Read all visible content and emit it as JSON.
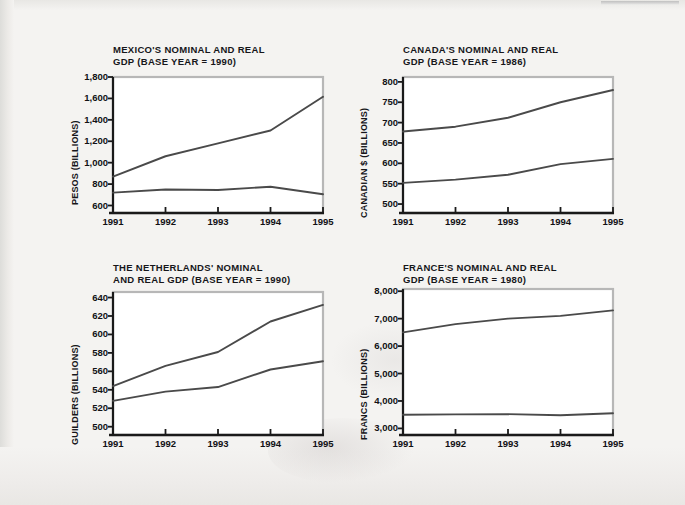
{
  "page": {
    "background_color": "#f4f3f1",
    "line_color": "#4a4a4a",
    "axis_color": "#1a1a1a",
    "frame_color": "#b7b7b7"
  },
  "charts": [
    {
      "id": "mexico",
      "title": "MEXICO'S NOMINAL AND REAL\nGDP (BASE YEAR = 1990)",
      "ylabel": "PESOS (BILLIONS)",
      "yticks": [
        "1,800",
        "1,600",
        "1,400",
        "1,200",
        "1,000",
        "800",
        "600"
      ],
      "xticks": [
        "1991",
        "1992",
        "1993",
        "1994",
        "1995"
      ]
    },
    {
      "id": "canada",
      "title": "CANADA'S NOMINAL AND REAL\nGDP (BASE YEAR = 1986)",
      "ylabel": "CANADIAN $ (BILLIONS)",
      "yticks": [
        "800",
        "750",
        "700",
        "650",
        "600",
        "550",
        "500"
      ],
      "xticks": [
        "1991",
        "1992",
        "1993",
        "1994",
        "1995"
      ]
    },
    {
      "id": "netherlands",
      "title": "THE NETHERLANDS' NOMINAL\nAND REAL GDP (BASE YEAR = 1990)",
      "ylabel": "GUILDERS (BILLIONS)",
      "yticks": [
        "640",
        "620",
        "600",
        "580",
        "560",
        "540",
        "520",
        "500"
      ],
      "xticks": [
        "1991",
        "1992",
        "1993",
        "1994",
        "1995"
      ]
    },
    {
      "id": "france",
      "title": "FRANCE'S NOMINAL AND REAL\nGDP (BASE YEAR = 1980)",
      "ylabel": "FRANCS (BILLIONS)",
      "yticks": [
        "8,000",
        "7,000",
        "6,000",
        "5,000",
        "4,000",
        "3,000"
      ],
      "xticks": [
        "1991",
        "1992",
        "1993",
        "1994",
        "1995"
      ]
    }
  ],
  "chart_data": [
    {
      "type": "line",
      "id": "mexico",
      "title": "MEXICO'S NOMINAL AND REAL GDP (BASE YEAR = 1990)",
      "xlabel": "",
      "ylabel": "PESOS (BILLIONS)",
      "x": [
        1991,
        1992,
        1993,
        1994,
        1995
      ],
      "categories": [
        "1991",
        "1992",
        "1993",
        "1994",
        "1995"
      ],
      "series": [
        {
          "name": "Nominal GDP",
          "values": [
            870,
            1060,
            1180,
            1300,
            1615
          ]
        },
        {
          "name": "Real GDP",
          "values": [
            720,
            750,
            745,
            775,
            705
          ]
        }
      ],
      "ylim": [
        530,
        1800
      ],
      "yticks": [
        600,
        800,
        1000,
        1200,
        1400,
        1600,
        1800
      ],
      "grid": false,
      "legend": "none"
    },
    {
      "type": "line",
      "id": "canada",
      "title": "CANADA'S NOMINAL AND REAL GDP (BASE YEAR = 1986)",
      "xlabel": "",
      "ylabel": "CANADIAN $ (BILLIONS)",
      "x": [
        1991,
        1992,
        1993,
        1994,
        1995
      ],
      "categories": [
        "1991",
        "1992",
        "1993",
        "1994",
        "1995"
      ],
      "series": [
        {
          "name": "Nominal GDP",
          "values": [
            678,
            690,
            712,
            750,
            780
          ]
        },
        {
          "name": "Real GDP",
          "values": [
            552,
            560,
            572,
            598,
            611
          ]
        }
      ],
      "ylim": [
        478,
        812
      ],
      "yticks": [
        500,
        550,
        600,
        650,
        700,
        750,
        800
      ],
      "grid": false,
      "legend": "none"
    },
    {
      "type": "line",
      "id": "netherlands",
      "title": "THE NETHERLANDS' NOMINAL AND REAL GDP (BASE YEAR = 1990)",
      "xlabel": "",
      "ylabel": "GUILDERS (BILLIONS)",
      "x": [
        1991,
        1992,
        1993,
        1994,
        1995
      ],
      "categories": [
        "1991",
        "1992",
        "1993",
        "1994",
        "1995"
      ],
      "series": [
        {
          "name": "Nominal GDP",
          "values": [
            544,
            566,
            581,
            614,
            632
          ]
        },
        {
          "name": "Real GDP",
          "values": [
            528,
            538,
            543,
            562,
            571
          ]
        }
      ],
      "ylim": [
        491,
        646
      ],
      "yticks": [
        500,
        520,
        540,
        560,
        580,
        600,
        620,
        640
      ],
      "grid": false,
      "legend": "none"
    },
    {
      "type": "line",
      "id": "france",
      "title": "FRANCE'S NOMINAL AND REAL GDP (BASE YEAR = 1980)",
      "xlabel": "",
      "ylabel": "FRANCS (BILLIONS)",
      "x": [
        1991,
        1992,
        1993,
        1994,
        1995
      ],
      "categories": [
        "1991",
        "1992",
        "1993",
        "1994",
        "1995"
      ],
      "series": [
        {
          "name": "Nominal GDP",
          "values": [
            6500,
            6800,
            7000,
            7100,
            7300
          ]
        },
        {
          "name": "Real GDP",
          "values": [
            3500,
            3510,
            3520,
            3480,
            3550
          ]
        }
      ],
      "ylim": [
        2760,
        8080
      ],
      "yticks": [
        3000,
        4000,
        5000,
        6000,
        7000,
        8000
      ],
      "grid": false,
      "legend": "none"
    }
  ]
}
